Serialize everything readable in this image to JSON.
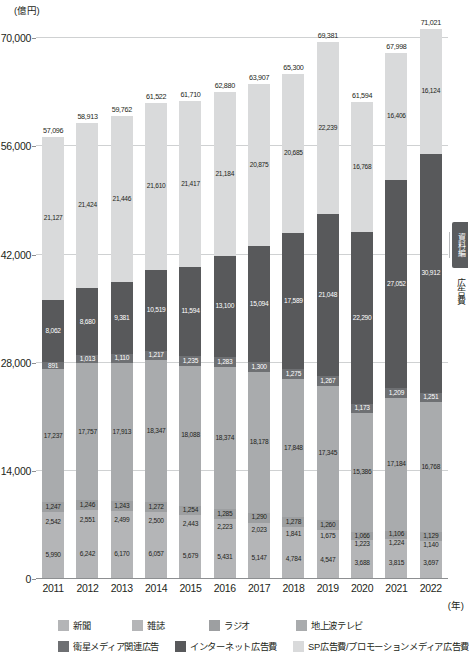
{
  "axis": {
    "unit_label": "(億円)",
    "x_unit_label": "(年)",
    "y_ticks": [
      "0",
      "14,000",
      "28,000",
      "42,000",
      "56,000",
      "70,000"
    ],
    "y_tick_values": [
      0,
      14000,
      28000,
      42000,
      56000,
      70000
    ],
    "y_min": 0,
    "y_max": 72500
  },
  "side_panel": {
    "tab_label": "資料編",
    "vertical_text": "広告費"
  },
  "legend": {
    "row1": [
      {
        "label": "新聞",
        "color": "#b4b5b7"
      },
      {
        "label": "雑誌",
        "color": "#b4b5b7"
      },
      {
        "label": "ラジオ",
        "color": "#9d9fa1"
      },
      {
        "label": "地上波テレビ",
        "color": "#a9abad"
      }
    ],
    "row2": [
      {
        "label": "衛星メディア関連広告",
        "color": "#6e7073"
      },
      {
        "label": "インターネット広告費",
        "color": "#58595b"
      },
      {
        "label": "SP広告費/プロモーションメディア広告費",
        "color": "#d9dadb"
      }
    ]
  },
  "chart_data": {
    "type": "bar",
    "subtype": "stacked",
    "title": "",
    "xlabel": "(年)",
    "ylabel": "(億円)",
    "ylim": [
      0,
      70000
    ],
    "grid": true,
    "legend_position": "bottom",
    "categories": [
      "2011",
      "2012",
      "2013",
      "2014",
      "2015",
      "2016",
      "2017",
      "2018",
      "2019",
      "2020",
      "2021",
      "2022"
    ],
    "totals": [
      57096,
      58913,
      59762,
      61522,
      61710,
      62880,
      63907,
      65300,
      69381,
      61594,
      67998,
      71021
    ],
    "series": [
      {
        "name": "新聞",
        "color": "#b4b5b7",
        "values": [
          5990,
          6242,
          6170,
          6057,
          5679,
          5431,
          5147,
          4784,
          4547,
          3688,
          3815,
          3697
        ]
      },
      {
        "name": "雑誌",
        "color": "#b4b5b7",
        "values": [
          2542,
          2551,
          2499,
          2500,
          2443,
          2223,
          2023,
          1841,
          1675,
          1223,
          1224,
          1140
        ]
      },
      {
        "name": "ラジオ",
        "color": "#9d9fa1",
        "values": [
          1247,
          1246,
          1243,
          1272,
          1254,
          1285,
          1290,
          1278,
          1260,
          1066,
          1106,
          1129
        ]
      },
      {
        "name": "地上波テレビ",
        "color": "#a9abad",
        "values": [
          17237,
          17757,
          17913,
          18347,
          18088,
          18374,
          18178,
          17848,
          17345,
          15386,
          17184,
          16768
        ]
      },
      {
        "name": "衛星メディア関連広告",
        "color": "#6e7073",
        "values": [
          891,
          1013,
          1110,
          1217,
          1235,
          1283,
          1300,
          1275,
          1267,
          1173,
          1209,
          1251
        ]
      },
      {
        "name": "インターネット広告費",
        "color": "#58595b",
        "values": [
          8062,
          8680,
          9381,
          10519,
          11594,
          13100,
          15094,
          17589,
          21048,
          22290,
          27052,
          30912
        ]
      },
      {
        "name": "SP広告費/プロモーションメディア広告費",
        "color": "#d9dadb",
        "values": [
          21127,
          21424,
          21446,
          21610,
          21417,
          21184,
          20875,
          20685,
          22239,
          16768,
          16406,
          16124
        ]
      }
    ]
  }
}
